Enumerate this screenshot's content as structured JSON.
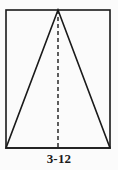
{
  "figure": {
    "caption": "3-12",
    "background_color": "#fbfbfb",
    "stroke_color": "#1a1a1a",
    "canvas": {
      "width": 118,
      "height": 170
    },
    "rectangle": {
      "name": "bounding-rectangle",
      "x": 6,
      "y": 10,
      "width": 104,
      "height": 138,
      "stroke_width": 1.6,
      "fill": "none"
    },
    "triangle": {
      "name": "inscribed-triangle",
      "apex": {
        "x": 58,
        "y": 10
      },
      "base_left": {
        "x": 6,
        "y": 148
      },
      "base_right": {
        "x": 110,
        "y": 148
      },
      "stroke_width": 1.6,
      "fill": "none"
    },
    "altitude": {
      "name": "dashed-altitude",
      "x1": 58,
      "y1": 10,
      "x2": 58,
      "y2": 148,
      "stroke_width": 1.4,
      "dash_pattern": "4 3"
    }
  }
}
